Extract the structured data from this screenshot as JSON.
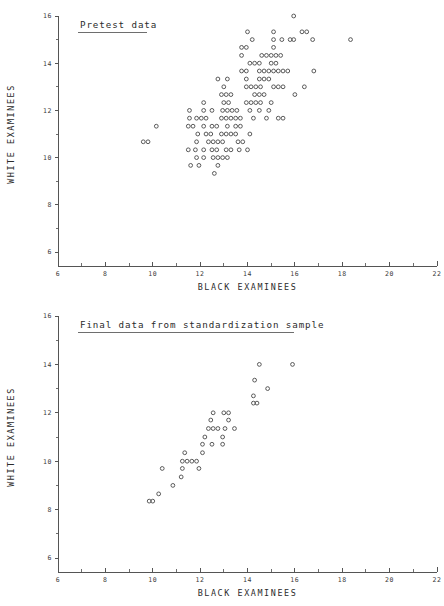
{
  "page": {
    "width": 444,
    "height": 606,
    "background": "#ffffff",
    "ink_color": "#2b2b2b"
  },
  "chart_data": [
    {
      "id": "pretest",
      "type": "scatter",
      "title": "Pretest data",
      "title_underlined": true,
      "xlabel": "BLACK EXAMINEES",
      "ylabel": "WHITE EXAMINEES",
      "xlim": [
        6,
        22
      ],
      "ylim": [
        6,
        16
      ],
      "xticks": [
        6,
        8,
        10,
        12,
        14,
        16,
        18,
        20,
        22
      ],
      "xticklabels": [
        "6",
        "8",
        "10",
        "12",
        "14",
        "16",
        "18",
        "20",
        "22"
      ],
      "xminor_ticks": [
        7,
        9,
        11,
        13,
        15,
        17,
        19,
        21
      ],
      "yticks": [
        6,
        8,
        10,
        12,
        14,
        16
      ],
      "yticklabels": [
        "6",
        "8",
        "10",
        "12",
        "14",
        "16"
      ],
      "yminor_ticks": [
        7,
        9,
        11,
        13,
        15
      ],
      "grid": false,
      "legend": "none",
      "marker": "open-circle",
      "marker_radius_px": 1.9,
      "points": [
        [
          15.95,
          16.0
        ],
        [
          14.0,
          15.33
        ],
        [
          15.1,
          15.33
        ],
        [
          16.3,
          15.33
        ],
        [
          16.5,
          15.33
        ],
        [
          14.2,
          15.0
        ],
        [
          15.1,
          15.0
        ],
        [
          15.45,
          15.0
        ],
        [
          15.8,
          15.0
        ],
        [
          15.95,
          15.0
        ],
        [
          16.75,
          15.0
        ],
        [
          18.35,
          15.0
        ],
        [
          13.75,
          14.67
        ],
        [
          13.95,
          14.67
        ],
        [
          15.1,
          14.67
        ],
        [
          13.75,
          14.33
        ],
        [
          14.6,
          14.33
        ],
        [
          14.8,
          14.33
        ],
        [
          15.0,
          14.33
        ],
        [
          15.2,
          14.33
        ],
        [
          15.4,
          14.33
        ],
        [
          14.1,
          14.0
        ],
        [
          14.3,
          14.0
        ],
        [
          14.5,
          14.0
        ],
        [
          15.0,
          14.0
        ],
        [
          15.2,
          14.0
        ],
        [
          13.75,
          13.67
        ],
        [
          13.95,
          13.67
        ],
        [
          14.5,
          13.67
        ],
        [
          14.7,
          13.67
        ],
        [
          14.9,
          13.67
        ],
        [
          15.1,
          13.67
        ],
        [
          15.3,
          13.67
        ],
        [
          15.5,
          13.67
        ],
        [
          15.7,
          13.67
        ],
        [
          16.8,
          13.67
        ],
        [
          12.75,
          13.33
        ],
        [
          13.15,
          13.33
        ],
        [
          13.95,
          13.33
        ],
        [
          14.5,
          13.33
        ],
        [
          14.7,
          13.33
        ],
        [
          14.9,
          13.33
        ],
        [
          13.0,
          13.0
        ],
        [
          13.95,
          13.0
        ],
        [
          14.15,
          13.0
        ],
        [
          14.35,
          13.0
        ],
        [
          14.55,
          13.0
        ],
        [
          15.1,
          13.0
        ],
        [
          15.3,
          13.0
        ],
        [
          15.5,
          13.0
        ],
        [
          16.4,
          13.0
        ],
        [
          12.9,
          12.67
        ],
        [
          13.1,
          12.67
        ],
        [
          13.3,
          12.67
        ],
        [
          14.3,
          12.67
        ],
        [
          14.5,
          12.67
        ],
        [
          14.7,
          12.67
        ],
        [
          16.0,
          12.67
        ],
        [
          12.15,
          12.33
        ],
        [
          13.0,
          12.33
        ],
        [
          13.2,
          12.33
        ],
        [
          13.95,
          12.33
        ],
        [
          14.15,
          12.33
        ],
        [
          14.35,
          12.33
        ],
        [
          14.55,
          12.33
        ],
        [
          15.0,
          12.33
        ],
        [
          11.55,
          12.0
        ],
        [
          12.15,
          12.0
        ],
        [
          12.5,
          12.0
        ],
        [
          12.95,
          12.0
        ],
        [
          13.15,
          12.0
        ],
        [
          13.35,
          12.0
        ],
        [
          13.55,
          12.0
        ],
        [
          14.1,
          12.0
        ],
        [
          14.5,
          12.0
        ],
        [
          14.9,
          12.0
        ],
        [
          11.55,
          11.67
        ],
        [
          11.85,
          11.67
        ],
        [
          12.05,
          11.67
        ],
        [
          12.25,
          11.67
        ],
        [
          12.9,
          11.67
        ],
        [
          13.1,
          11.67
        ],
        [
          13.3,
          11.67
        ],
        [
          13.5,
          11.67
        ],
        [
          13.7,
          11.67
        ],
        [
          14.25,
          11.67
        ],
        [
          14.8,
          11.67
        ],
        [
          15.3,
          11.67
        ],
        [
          15.5,
          11.67
        ],
        [
          10.15,
          11.33
        ],
        [
          11.5,
          11.33
        ],
        [
          11.7,
          11.33
        ],
        [
          12.15,
          11.33
        ],
        [
          12.5,
          11.33
        ],
        [
          12.7,
          11.33
        ],
        [
          13.15,
          11.33
        ],
        [
          13.5,
          11.33
        ],
        [
          13.7,
          11.33
        ],
        [
          11.9,
          11.0
        ],
        [
          12.25,
          11.0
        ],
        [
          12.45,
          11.0
        ],
        [
          12.9,
          11.0
        ],
        [
          13.1,
          11.0
        ],
        [
          13.3,
          11.0
        ],
        [
          13.5,
          11.0
        ],
        [
          14.1,
          11.0
        ],
        [
          9.6,
          10.67
        ],
        [
          9.8,
          10.67
        ],
        [
          11.85,
          10.67
        ],
        [
          12.35,
          10.67
        ],
        [
          12.55,
          10.67
        ],
        [
          12.75,
          10.67
        ],
        [
          12.95,
          10.67
        ],
        [
          13.6,
          10.67
        ],
        [
          13.8,
          10.67
        ],
        [
          11.5,
          10.33
        ],
        [
          11.8,
          10.33
        ],
        [
          12.15,
          10.33
        ],
        [
          12.5,
          10.33
        ],
        [
          12.7,
          10.33
        ],
        [
          13.1,
          10.33
        ],
        [
          13.3,
          10.33
        ],
        [
          13.65,
          10.33
        ],
        [
          14.0,
          10.33
        ],
        [
          11.85,
          10.0
        ],
        [
          12.15,
          10.0
        ],
        [
          12.55,
          10.0
        ],
        [
          12.75,
          10.0
        ],
        [
          12.95,
          10.0
        ],
        [
          13.15,
          10.0
        ],
        [
          11.6,
          9.67
        ],
        [
          11.95,
          9.67
        ],
        [
          12.75,
          9.67
        ],
        [
          12.6,
          9.33
        ]
      ],
      "n_points": 131
    },
    {
      "id": "final",
      "type": "scatter",
      "title": "Final data from standardization sample",
      "title_underlined": true,
      "xlabel": "BLACK EXAMINEES",
      "ylabel": "WHITE EXAMINEES",
      "xlim": [
        6,
        22
      ],
      "ylim": [
        6,
        16
      ],
      "xticks": [
        6,
        8,
        10,
        12,
        14,
        16,
        18,
        20,
        22
      ],
      "xticklabels": [
        "6",
        "8",
        "10",
        "12",
        "14",
        "16",
        "18",
        "20",
        "22"
      ],
      "xminor_ticks": [
        7,
        9,
        11,
        13,
        15,
        17,
        19,
        21
      ],
      "yticks": [
        6,
        8,
        10,
        12,
        14,
        16
      ],
      "yticklabels": [
        "6",
        "8",
        "10",
        "12",
        "14",
        "16"
      ],
      "yminor_ticks": [
        7,
        9,
        11,
        13,
        15
      ],
      "grid": false,
      "legend": "none",
      "marker": "open-circle",
      "marker_radius_px": 1.9,
      "points": [
        [
          14.5,
          14.0
        ],
        [
          15.9,
          14.0
        ],
        [
          14.3,
          13.35
        ],
        [
          14.85,
          13.0
        ],
        [
          14.25,
          12.7
        ],
        [
          14.25,
          12.4
        ],
        [
          14.4,
          12.4
        ],
        [
          12.55,
          12.0
        ],
        [
          13.0,
          12.0
        ],
        [
          13.2,
          12.0
        ],
        [
          12.45,
          11.7
        ],
        [
          13.2,
          11.7
        ],
        [
          12.35,
          11.35
        ],
        [
          12.55,
          11.35
        ],
        [
          12.75,
          11.35
        ],
        [
          13.05,
          11.35
        ],
        [
          13.45,
          11.35
        ],
        [
          12.2,
          11.0
        ],
        [
          12.95,
          11.0
        ],
        [
          12.1,
          10.7
        ],
        [
          12.5,
          10.7
        ],
        [
          12.95,
          10.7
        ],
        [
          11.35,
          10.35
        ],
        [
          12.1,
          10.35
        ],
        [
          11.25,
          10.0
        ],
        [
          11.45,
          10.0
        ],
        [
          11.65,
          10.0
        ],
        [
          11.85,
          10.0
        ],
        [
          10.4,
          9.7
        ],
        [
          11.25,
          9.7
        ],
        [
          11.95,
          9.7
        ],
        [
          11.2,
          9.35
        ],
        [
          10.85,
          9.0
        ],
        [
          10.25,
          8.65
        ],
        [
          9.85,
          8.35
        ],
        [
          10.0,
          8.35
        ]
      ],
      "n_points": 36
    }
  ]
}
